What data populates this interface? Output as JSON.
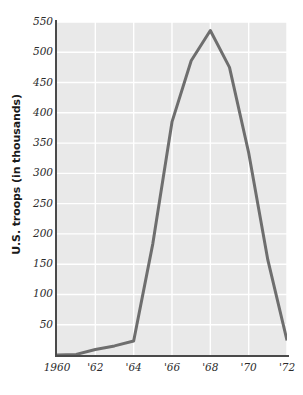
{
  "chart_data": {
    "type": "line",
    "title": "",
    "xlabel": "",
    "ylabel": "U.S. troops (in thousands)",
    "xlim": [
      1960,
      1972
    ],
    "ylim": [
      0,
      550
    ],
    "grid": true,
    "legend": "none",
    "line_color": "#6e6e6e",
    "plot_bg_color": "#e9e9e9",
    "gridline_color": "#ffffff",
    "axis_color": "#4a4a4a",
    "x": [
      1960,
      1961,
      1962,
      1963,
      1964,
      1965,
      1966,
      1967,
      1968,
      1969,
      1970,
      1971,
      1972
    ],
    "values": [
      0,
      1,
      9,
      15,
      23,
      184,
      385,
      486,
      536,
      475,
      334,
      157,
      24
    ],
    "series": [
      {
        "name": "U.S. troops in Vietnam",
        "values": [
          0,
          1,
          9,
          15,
          23,
          184,
          385,
          486,
          536,
          475,
          334,
          157,
          24
        ]
      }
    ],
    "x_tick_labels": [
      "1960",
      "'62",
      "'64",
      "'66",
      "'68",
      "'70",
      "'72"
    ],
    "x_tick_values": [
      1960,
      1962,
      1964,
      1966,
      1968,
      1970,
      1972
    ],
    "y_tick_labels": [
      "50",
      "100",
      "150",
      "200",
      "250",
      "300",
      "350",
      "400",
      "450",
      "500",
      "550"
    ],
    "y_tick_values": [
      50,
      100,
      150,
      200,
      250,
      300,
      350,
      400,
      450,
      500,
      550
    ]
  }
}
